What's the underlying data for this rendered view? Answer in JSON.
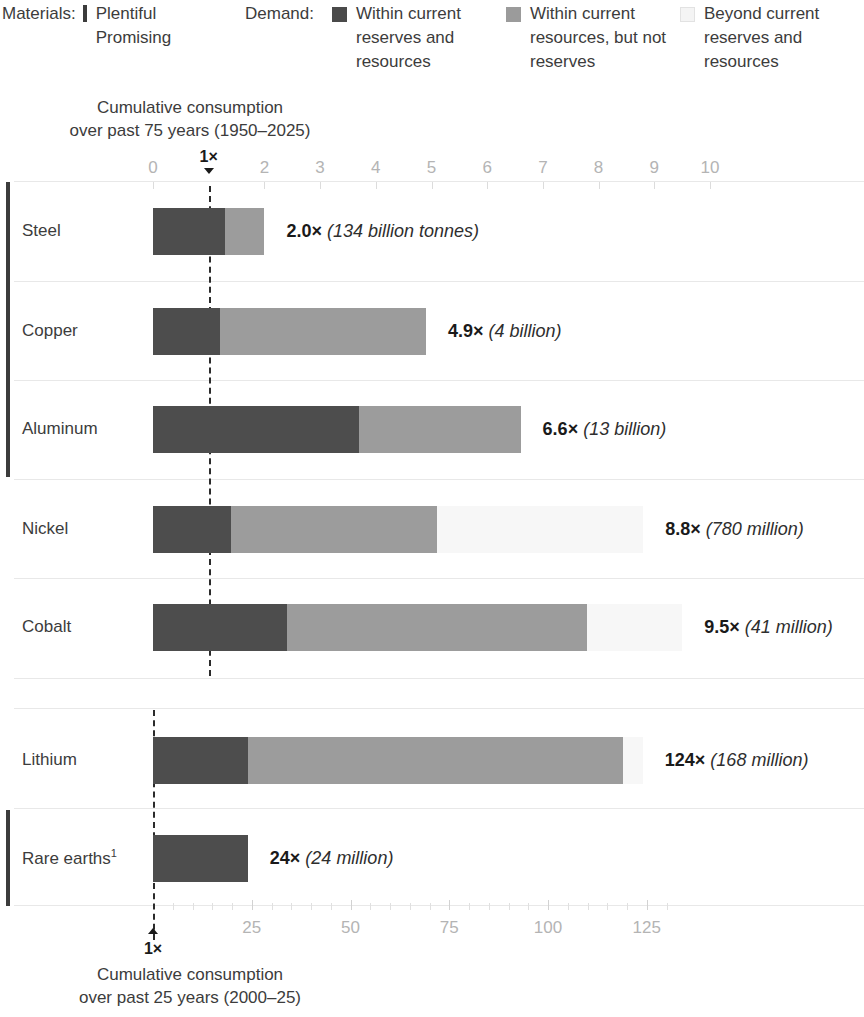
{
  "legend": {
    "materials_title": "Materials:",
    "materials_items": [
      {
        "label": "Plentiful",
        "swatch": "plentiful-bracket"
      },
      {
        "label": "Promising",
        "swatch": "promising-bracket"
      }
    ],
    "demand_title": "Demand:",
    "demand_items": [
      {
        "label": "Within current reserves and resources",
        "swatch": "dark-square",
        "color": "#4a4a4a"
      },
      {
        "label": "Within current resources, but not reserves",
        "swatch": "mid-grey-square",
        "color": "#9b9b9b"
      },
      {
        "label": "Beyond current reserves and resources",
        "swatch": "pale-square",
        "color": "#f4f4f4"
      }
    ]
  },
  "top_axis": {
    "caption_line1": "Cumulative consumption",
    "caption_line2": "over past 75 years (1950–2025)",
    "ticks": [
      "0",
      "1×",
      "2",
      "3",
      "4",
      "5",
      "6",
      "7",
      "8",
      "9",
      "10"
    ],
    "highlight_tick": "1×"
  },
  "bottom_axis": {
    "caption_line1": "Cumulative consumption",
    "caption_line2": "over past 25 years (2000–25)",
    "ticks": [
      "25",
      "50",
      "75",
      "100",
      "125"
    ],
    "origin_label": "1×"
  },
  "chart_data": {
    "type": "bar",
    "stacked": true,
    "orientation": "horizontal",
    "segment_names": [
      "Within current reserves and resources",
      "Within current resources, but not reserves",
      "Beyond current reserves and resources"
    ],
    "segment_colors": [
      "#4d4d4d",
      "#9c9c9c",
      "#f7f7f7"
    ],
    "groups": [
      {
        "name": "Plentiful",
        "materials": [
          "Steel",
          "Copper",
          "Aluminum"
        ]
      },
      {
        "name": "",
        "materials": [
          "Nickel",
          "Cobalt"
        ]
      },
      {
        "name": "",
        "materials": [
          "Lithium"
        ]
      },
      {
        "name": "Promising",
        "materials": [
          "Rare earths"
        ]
      }
    ],
    "axis_groups": [
      {
        "axis": "top",
        "label": "Cumulative consumption over past 75 years (1950–2025)",
        "xmin": 0,
        "xmax": 10,
        "tick_step": 1
      },
      {
        "axis": "bottom",
        "label": "Cumulative consumption over past 25 years (2000–25)",
        "xmin": 0,
        "xmax": 130,
        "tick_step": 25
      }
    ],
    "categories": [
      "Steel",
      "Copper",
      "Aluminum",
      "Nickel",
      "Cobalt",
      "Lithium",
      "Rare earths"
    ],
    "rows": [
      {
        "material": "Steel",
        "axis": "top",
        "total": 2.0,
        "value_label": "2.0×",
        "value_note": "(134 billion tonnes)",
        "segments": [
          1.3,
          0.7,
          0.0
        ]
      },
      {
        "material": "Copper",
        "axis": "top",
        "total": 4.9,
        "value_label": "4.9×",
        "value_note": "(4 billion)",
        "segments": [
          1.2,
          3.7,
          0.0
        ]
      },
      {
        "material": "Aluminum",
        "axis": "top",
        "total": 6.6,
        "value_label": "6.6×",
        "value_note": "(13 billion)",
        "segments": [
          3.7,
          2.9,
          0.0
        ]
      },
      {
        "material": "Nickel",
        "axis": "top",
        "total": 8.8,
        "value_label": "8.8×",
        "value_note": "(780 million)",
        "segments": [
          1.4,
          3.7,
          3.7
        ]
      },
      {
        "material": "Cobalt",
        "axis": "top",
        "total": 9.5,
        "value_label": "9.5×",
        "value_note": "(41 million)",
        "segments": [
          2.4,
          5.4,
          1.7
        ]
      },
      {
        "material": "Lithium",
        "axis": "bottom",
        "total": 124,
        "value_label": "124×",
        "value_note": "(168 million)",
        "segments": [
          24,
          95,
          5
        ]
      },
      {
        "material": "Rare earths",
        "axis": "bottom",
        "total": 24,
        "value_label": "24×",
        "value_note": "(24 million)",
        "segments": [
          24,
          0,
          0
        ],
        "footnote_marker": "1"
      }
    ]
  },
  "rows_display": [
    {
      "label": "Steel",
      "value_bold": "2.0×",
      "value_note": "(134 billion tonnes)"
    },
    {
      "label": "Copper",
      "value_bold": "4.9×",
      "value_note": "(4 billion)"
    },
    {
      "label": "Aluminum",
      "value_bold": "6.6×",
      "value_note": "(13 billion)"
    },
    {
      "label": "Nickel",
      "value_bold": "8.8×",
      "value_note": "(780 million)"
    },
    {
      "label": "Cobalt",
      "value_bold": "9.5×",
      "value_note": "(41 million)"
    },
    {
      "label": "Lithium",
      "value_bold": "124×",
      "value_note": "(168 million)"
    },
    {
      "label": "Rare earths",
      "value_bold": "24×",
      "value_note": "(24 million)",
      "footnote": "1"
    }
  ]
}
